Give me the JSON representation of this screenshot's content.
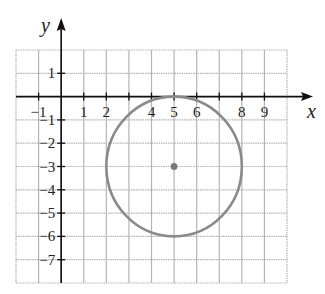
{
  "chart_data": {
    "type": "scatter",
    "title": "",
    "xlabel": "x",
    "ylabel": "y",
    "xlim": [
      -2,
      10
    ],
    "ylim": [
      -8,
      2
    ],
    "grid": true,
    "x_tick_labels": [
      {
        "value": -1,
        "label": "−1"
      },
      {
        "value": 1,
        "label": "1"
      },
      {
        "value": 2,
        "label": "2"
      },
      {
        "value": 4,
        "label": "4"
      },
      {
        "value": 5,
        "label": "5"
      },
      {
        "value": 6,
        "label": "6"
      },
      {
        "value": 8,
        "label": "8"
      },
      {
        "value": 9,
        "label": "9"
      }
    ],
    "y_tick_labels": [
      {
        "value": 1,
        "label": "1"
      },
      {
        "value": -1,
        "label": "−1"
      },
      {
        "value": -2,
        "label": "−2"
      },
      {
        "value": -3,
        "label": "−3"
      },
      {
        "value": -4,
        "label": "−4"
      },
      {
        "value": -5,
        "label": "−5"
      },
      {
        "value": -6,
        "label": "−6"
      },
      {
        "value": -7,
        "label": "−7"
      }
    ],
    "shapes": [
      {
        "kind": "circle",
        "center": [
          5,
          -3
        ],
        "radius": 3,
        "color": "#8a8a8a"
      }
    ],
    "points": [
      {
        "x": 5,
        "y": -3,
        "color": "#777777",
        "label": "center"
      }
    ]
  },
  "colors": {
    "grid": "#b4b4b4",
    "axis": "#111111",
    "circle": "#8a8a8a",
    "center": "#777777"
  }
}
